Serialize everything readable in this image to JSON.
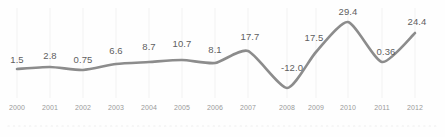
{
  "chart_data": {
    "type": "line",
    "title": "",
    "subtitle": "",
    "xlabel": "",
    "ylabel": "",
    "grid": "vertical-only",
    "legend": "none",
    "line_color": "#8c8c8c",
    "label_color": "#5f5f5f",
    "tick_color": "#9a9a9a",
    "gridline_color": "#f2f2f2",
    "baseline_color": "#ededed",
    "background_color": "#fefefe",
    "categories": [
      "2000",
      "2001",
      "2002",
      "2003",
      "2004",
      "2005",
      "2006",
      "2007",
      "2008",
      "2009",
      "2010",
      "2011",
      "2012"
    ],
    "values": [
      1.5,
      2.8,
      0.75,
      6.6,
      8.7,
      10.7,
      8.1,
      17.7,
      -12.0,
      17.5,
      29.4,
      0.36,
      24.4
    ],
    "labels": [
      "1.5",
      "2.8",
      "0.75",
      "6.6",
      "8.7",
      "10.7",
      "8.1",
      "17.7",
      "-12.0",
      "17.5",
      "29.4",
      "0.36",
      "24.4"
    ],
    "ylim": [
      -12.0,
      29.4
    ],
    "points": [
      {
        "x": 17,
        "y": 69,
        "label": "1.5",
        "label_x": 17,
        "label_y": 54,
        "tick": "2000",
        "tick_x": 17
      },
      {
        "x": 50,
        "y": 67,
        "label": "2.8",
        "label_x": 50,
        "label_y": 50,
        "tick": "2001",
        "tick_x": 50
      },
      {
        "x": 83,
        "y": 70,
        "label": "0.75",
        "label_x": 83,
        "label_y": 54,
        "tick": "2002",
        "tick_x": 83
      },
      {
        "x": 116,
        "y": 64,
        "label": "6.6",
        "label_x": 116,
        "label_y": 45,
        "tick": "2003",
        "tick_x": 116
      },
      {
        "x": 149,
        "y": 62,
        "label": "8.7",
        "label_x": 149,
        "label_y": 41,
        "tick": "2004",
        "tick_x": 149
      },
      {
        "x": 182,
        "y": 60,
        "label": "10.7",
        "label_x": 182,
        "label_y": 38,
        "tick": "2005",
        "tick_x": 182
      },
      {
        "x": 215,
        "y": 63,
        "label": "8.1",
        "label_x": 215,
        "label_y": 44,
        "tick": "2006",
        "tick_x": 215
      },
      {
        "x": 248,
        "y": 51,
        "label": "17.7",
        "label_x": 250,
        "label_y": 31,
        "tick": "2007",
        "tick_x": 248
      },
      {
        "x": 287,
        "y": 88,
        "label": "-12.0",
        "label_x": 292,
        "label_y": 62,
        "tick": "2008",
        "tick_x": 287
      },
      {
        "x": 316,
        "y": 52,
        "label": "17.5",
        "label_x": 314,
        "label_y": 32,
        "tick": "2009",
        "tick_x": 316
      },
      {
        "x": 348,
        "y": 22,
        "label": "29.4",
        "label_x": 348,
        "label_y": 6,
        "tick": "2010",
        "tick_x": 348
      },
      {
        "x": 382,
        "y": 62,
        "label": "0.36",
        "label_x": 386,
        "label_y": 46,
        "tick": "2011",
        "tick_x": 382
      },
      {
        "x": 415,
        "y": 33,
        "label": "24.4",
        "label_x": 417,
        "label_y": 16,
        "tick": "2012",
        "tick_x": 415
      }
    ],
    "gridlines_x": [
      17,
      50,
      83,
      116,
      149,
      182,
      215,
      248,
      287,
      316,
      348,
      382,
      415
    ],
    "gridline_top": 8,
    "gridline_bottom": 98,
    "baseline_y": 126,
    "baseline_x_start": 8,
    "baseline_x_end": 437
  }
}
